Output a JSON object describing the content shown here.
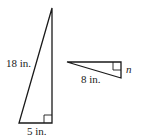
{
  "diagram": {
    "triangles": [
      {
        "name": "large-triangle",
        "hypotenuse_label": "18 in.",
        "base_label": "5 in.",
        "right_angle": true
      },
      {
        "name": "small-triangle",
        "long_leg_label": "8 in.",
        "short_leg_label": "n",
        "right_angle": true
      }
    ],
    "colors": {
      "stroke": "#1a1a1a",
      "background": "#ffffff"
    }
  }
}
